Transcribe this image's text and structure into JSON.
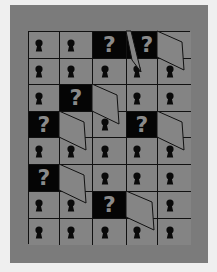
{
  "board": {
    "rows": 8,
    "cols": 5,
    "colors": {
      "background": "#efefef",
      "panel": "#7b7b7b",
      "cell": "#848484",
      "mystery_cell": "#050505",
      "question_mark": "#8a8a8a",
      "lock": "#0a0a0a",
      "grid_line": "#111111"
    },
    "cells": [
      [
        "lock",
        "lock",
        "question",
        "question",
        "door"
      ],
      [
        "lock",
        "lock",
        "lock",
        "lock",
        "lock"
      ],
      [
        "lock",
        "question",
        "door",
        "lock",
        "lock"
      ],
      [
        "question",
        "door",
        "lock",
        "question",
        "door"
      ],
      [
        "lock",
        "lock",
        "lock",
        "lock",
        "lock"
      ],
      [
        "question",
        "door",
        "lock",
        "lock",
        "lock"
      ],
      [
        "lock",
        "lock",
        "question",
        "door",
        "lock"
      ],
      [
        "lock",
        "lock",
        "lock",
        "lock",
        "lock"
      ]
    ],
    "question_label": "?",
    "icons": {
      "lock": "keyhole-icon",
      "question": "question-mark-icon",
      "door": "open-door-icon"
    },
    "open_doors": [
      {
        "row": 0,
        "col": 3,
        "points": "126,31 131,31 141,72 132,60"
      },
      {
        "row": 0,
        "col": 4,
        "points": "157,31 182,42 184,70 157,57"
      },
      {
        "row": 2,
        "col": 2,
        "points": "92,84 117,95 119,124 92,111"
      },
      {
        "row": 3,
        "col": 1,
        "points": "59,111 84,122 86,150 59,137"
      },
      {
        "row": 3,
        "col": 4,
        "points": "157,111 182,122 184,150 157,137"
      },
      {
        "row": 5,
        "col": 1,
        "points": "59,164 84,175 86,203 59,190"
      },
      {
        "row": 6,
        "col": 3,
        "points": "126,191 152,202 154,230 126,217"
      }
    ]
  }
}
